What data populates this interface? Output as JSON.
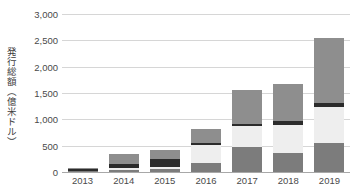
{
  "chart_data": {
    "type": "bar",
    "stacked": true,
    "title": "",
    "subtitle": "",
    "xlabel": "",
    "ylabel": "発行総額（億米ドル）",
    "categories": [
      "2013",
      "2014",
      "2015",
      "2016",
      "2017",
      "2018",
      "2019"
    ],
    "ylim": [
      0,
      3000
    ],
    "ytick_values": [
      0,
      500,
      1000,
      1500,
      2000,
      2500,
      3000
    ],
    "ytick_labels": [
      "0",
      "500",
      "1,000",
      "1,500",
      "2,000",
      "2,500",
      "3,000"
    ],
    "grid": true,
    "legend": "none",
    "series": [
      {
        "name": "segment-1",
        "color": "#7c7c7c",
        "values": [
          10,
          40,
          50,
          175,
          480,
          360,
          550
        ]
      },
      {
        "name": "segment-2",
        "color": "#eeeeee",
        "values": [
          5,
          40,
          45,
          330,
          390,
          530,
          680
        ]
      },
      {
        "name": "segment-3",
        "color": "#2b2b2b",
        "values": [
          45,
          80,
          155,
          45,
          40,
          70,
          80
        ]
      },
      {
        "name": "segment-4",
        "color": "#8e8e8e",
        "values": [
          10,
          185,
          175,
          270,
          650,
          710,
          1240
        ]
      }
    ],
    "totals": [
      70,
      345,
      425,
      820,
      1560,
      1670,
      2550
    ]
  },
  "axis": {
    "y_title": "発行総額（億米ドル）"
  }
}
